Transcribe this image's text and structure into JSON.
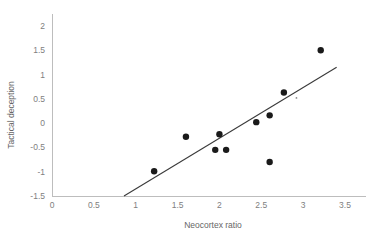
{
  "chart_data": {
    "type": "scatter",
    "title": "",
    "xlabel": "Neocortex ratio",
    "ylabel": "Tactical deception",
    "xlim": [
      0,
      3.75
    ],
    "ylim": [
      -1.5,
      2.25
    ],
    "grid": false,
    "legend": null,
    "xticks": [
      "0",
      "0.5",
      "1",
      "1.5",
      "2",
      "2.5",
      "3",
      "3.5"
    ],
    "xtick_values": [
      0,
      0.5,
      1,
      1.5,
      2,
      2.5,
      3,
      3.5
    ],
    "yticks": [
      "-1.5",
      "-1",
      "-0.5",
      "0",
      "0.5",
      "1",
      "1.5",
      "2"
    ],
    "ytick_values": [
      -1.5,
      -1,
      -0.5,
      0,
      0.5,
      1,
      1.5,
      2
    ],
    "series": [
      {
        "name": "observations",
        "marker": "filled-circle",
        "color": "#1a1a1a",
        "points": [
          {
            "x": 1.22,
            "y": -0.99
          },
          {
            "x": 1.6,
            "y": -0.28
          },
          {
            "x": 1.95,
            "y": -0.55
          },
          {
            "x": 2.0,
            "y": -0.23
          },
          {
            "x": 2.08,
            "y": -0.55
          },
          {
            "x": 2.44,
            "y": 0.02
          },
          {
            "x": 2.6,
            "y": 0.16
          },
          {
            "x": 2.6,
            "y": -0.8
          },
          {
            "x": 2.77,
            "y": 0.63
          },
          {
            "x": 3.21,
            "y": 1.5
          }
        ]
      }
    ],
    "trend_line": {
      "name": "regression-line",
      "color": "#3a3a3a",
      "x_start": 0.86,
      "y_start": -1.5,
      "x_end": 3.4,
      "y_end": 1.15
    },
    "artifact_points": [
      {
        "x": 2.92,
        "y": 0.52
      }
    ]
  }
}
